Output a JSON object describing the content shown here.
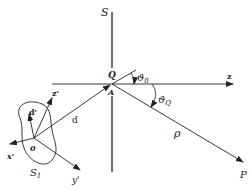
{
  "diagram": {
    "labels": {
      "S": "S",
      "Q": "Q",
      "A": "A",
      "theta0": "ϑ",
      "theta0_sub": "0",
      "thetaQ": "ϑ",
      "thetaQ_sub": "Q",
      "z": "z",
      "z_prime": "z'",
      "x_prime": "x'",
      "y_prime": "y'",
      "d": "d",
      "d_prime": "d'",
      "O": "0",
      "rho": "ρ",
      "P": "P",
      "S1": "S",
      "S1_sub": "1"
    },
    "colors": {
      "line": "#222222",
      "background": "#ffffff"
    }
  }
}
